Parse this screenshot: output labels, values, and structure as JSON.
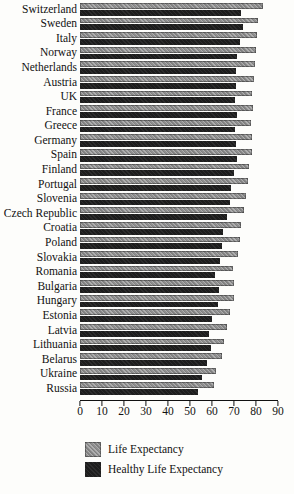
{
  "chart_data": {
    "type": "bar",
    "orientation": "horizontal",
    "categories": [
      "Switzerland",
      "Sweden",
      "Italy",
      "Norway",
      "Netherlands",
      "Austria",
      "UK",
      "France",
      "Greece",
      "Germany",
      "Spain",
      "Finland",
      "Portugal",
      "Slovenia",
      "Czech Republic",
      "Croatia",
      "Poland",
      "Slovakia",
      "Romania",
      "Bulgaria",
      "Hungary",
      "Estonia",
      "Latvia",
      "Lithuania",
      "Belarus",
      "Ukraine",
      "Russia"
    ],
    "series": [
      {
        "name": "Life Expectancy",
        "color": "#8f8f8f",
        "values": [
          83,
          81,
          80.5,
          80,
          79.5,
          79,
          78,
          78.5,
          77.5,
          78,
          78,
          77,
          76.5,
          75.5,
          74.5,
          73,
          72.5,
          72,
          69.5,
          70,
          70,
          68,
          67,
          65.5,
          64.5,
          62,
          61
        ]
      },
      {
        "name": "Healthy Life Expectancy",
        "color": "#1d1d1d",
        "values": [
          73,
          74,
          72.5,
          71.5,
          71,
          71,
          70.5,
          71.5,
          70.5,
          71,
          71.5,
          70,
          68.5,
          68,
          67,
          65,
          64.5,
          63.5,
          61.5,
          63,
          62.5,
          60,
          58.5,
          59.5,
          57.5,
          55.5,
          53.5
        ]
      }
    ],
    "title": "",
    "xlabel": "",
    "ylabel": "",
    "xlim": [
      0,
      90
    ],
    "x_ticks": [
      0,
      10,
      20,
      30,
      40,
      50,
      60,
      70,
      80,
      90
    ],
    "grid": false,
    "legend_position": "bottom-left"
  },
  "legend": {
    "life_expectancy_label": "Life Expectancy",
    "healthy_life_expectancy_label": "Healthy Life Expectancy"
  }
}
